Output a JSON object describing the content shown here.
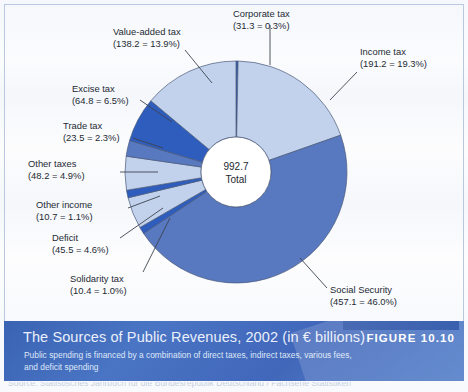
{
  "figure": {
    "badge_label": "FIGURE 10.10",
    "caption_title": "The Sources of Public Revenues, 2002 (in € billions)",
    "caption_subtitle": "Public spending is financed by a combination of direct taxes, indirect taxes, various fees, and deficit spending",
    "source_line": "Source: Statistisches Jahrbuch für die Bundesrepublik Deutschland / Fachserie Statistiken"
  },
  "center": {
    "value": "992.7",
    "label": "Total"
  },
  "colors": {
    "slice_light": "#c3d2ec",
    "slice_mid": "#5878c0",
    "slice_dark": "#2e5dbe",
    "outline": "#4a5a78",
    "leader_line": "#3c4450",
    "caption_bg": "#4167ba",
    "badge_bar": "#2c54a8",
    "text": "#242a33"
  },
  "chart_data": {
    "type": "pie",
    "title": "The Sources of Public Revenues, 2002 (in € billions)",
    "subtitle": "Public spending is financed by a combination of direct taxes, indirect taxes, various fees, and deficit spending",
    "units": "€ billions",
    "year": 2002,
    "total": 992.7,
    "total_label": "Total",
    "donut": true,
    "legend": "none",
    "labels_position": "outside-with-leader-lines",
    "start_angle_deg": 0,
    "direction": "clockwise",
    "categories": [
      "Corporate tax",
      "Income tax",
      "Social Security",
      "Solidarity tax",
      "Deficit",
      "Other income",
      "Other taxes",
      "Trade tax",
      "Excise tax",
      "Value-added tax"
    ],
    "values": [
      31.3,
      191.2,
      457.1,
      10.4,
      45.5,
      10.7,
      48.2,
      23.5,
      64.8,
      138.2
    ],
    "percents": [
      0.3,
      19.3,
      46.0,
      1.0,
      4.6,
      1.1,
      4.9,
      2.3,
      6.5,
      13.9
    ],
    "slices": [
      {
        "name": "Corporate tax",
        "value": 31.3,
        "percent": 0.3,
        "label_line1": "Corporate tax",
        "label_line2": "(31.3 = 0.3%)",
        "shade": "dark"
      },
      {
        "name": "Income tax",
        "value": 191.2,
        "percent": 19.3,
        "label_line1": "Income tax",
        "label_line2": "(191.2 = 19.3%)",
        "shade": "light"
      },
      {
        "name": "Social Security",
        "value": 457.1,
        "percent": 46.0,
        "label_line1": "Social Security",
        "label_line2": "(457.1 = 46.0%)",
        "shade": "mid"
      },
      {
        "name": "Solidarity tax",
        "value": 10.4,
        "percent": 1.0,
        "label_line1": "Solidarity tax",
        "label_line2": "(10.4 = 1.0%)",
        "shade": "dark"
      },
      {
        "name": "Deficit",
        "value": 45.5,
        "percent": 4.6,
        "label_line1": "Deficit",
        "label_line2": "(45.5 = 4.6%)",
        "shade": "light"
      },
      {
        "name": "Other income",
        "value": 10.7,
        "percent": 1.1,
        "label_line1": "Other income",
        "label_line2": "(10.7 = 1.1%)",
        "shade": "dark"
      },
      {
        "name": "Other taxes",
        "value": 48.2,
        "percent": 4.9,
        "label_line1": "Other taxes",
        "label_line2": "(48.2 = 4.9%)",
        "shade": "light"
      },
      {
        "name": "Trade tax",
        "value": 23.5,
        "percent": 2.3,
        "label_line1": "Trade tax",
        "label_line2": "(23.5 = 2.3%)",
        "shade": "mid"
      },
      {
        "name": "Excise tax",
        "value": 64.8,
        "percent": 6.5,
        "label_line1": "Excise tax",
        "label_line2": "(64.8 = 6.5%)",
        "shade": "dark"
      },
      {
        "name": "Value-added tax",
        "value": 138.2,
        "percent": 13.9,
        "label_line1": "Value-added tax",
        "label_line2": "(138.2 = 13.9%)",
        "shade": "light"
      }
    ]
  }
}
